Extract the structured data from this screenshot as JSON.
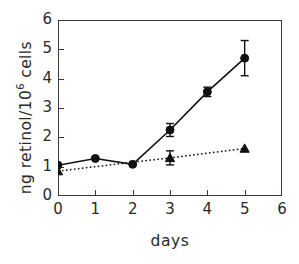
{
  "chart_data": {
    "type": "line",
    "title": "",
    "xlabel": "days",
    "ylabel": "ng retinol/10^6 cells",
    "ylabel_prefix": "ng retinol/10",
    "ylabel_exponent": "6",
    "ylabel_suffix": " cells",
    "xlim": [
      0,
      6
    ],
    "ylim": [
      0,
      6
    ],
    "xticks": [
      "0",
      "1",
      "2",
      "3",
      "4",
      "5",
      "6"
    ],
    "yticks": [
      "0",
      "1",
      "2",
      "3",
      "4",
      "5",
      "6"
    ],
    "grid": false,
    "legend": "none",
    "series": [
      {
        "name": "circles",
        "marker": "filled-circle",
        "linestyle": "solid",
        "color": "#111111",
        "x": [
          0,
          1,
          2,
          3,
          4,
          5
        ],
        "values": [
          1.05,
          1.28,
          1.08,
          2.25,
          3.55,
          4.7
        ],
        "errors": [
          0.0,
          0.0,
          0.0,
          0.22,
          0.16,
          0.6
        ]
      },
      {
        "name": "triangles",
        "marker": "filled-triangle",
        "linestyle": "dotted",
        "color": "#111111",
        "x": [
          0,
          3,
          5
        ],
        "values": [
          0.85,
          1.3,
          1.62
        ],
        "errors": [
          0.0,
          0.24,
          0.0
        ]
      }
    ]
  }
}
